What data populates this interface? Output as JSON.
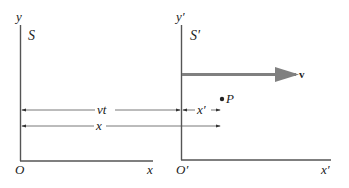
{
  "diagram": {
    "type": "reference-frames",
    "frame_s": {
      "name_label": "S",
      "y_axis_label": "y",
      "x_axis_label": "x",
      "origin_label": "O"
    },
    "frame_s_prime": {
      "name_label": "S′",
      "y_axis_label": "y′",
      "x_axis_label": "x′",
      "origin_label": "O′"
    },
    "velocity": {
      "label": "v"
    },
    "point": {
      "label": "P"
    },
    "distances": {
      "vt_label": "vt",
      "x_prime_label": "x′",
      "x_label": "x"
    },
    "colors": {
      "axis": "#555555",
      "velocity_arrow": "#808080",
      "text": "#222222"
    }
  }
}
